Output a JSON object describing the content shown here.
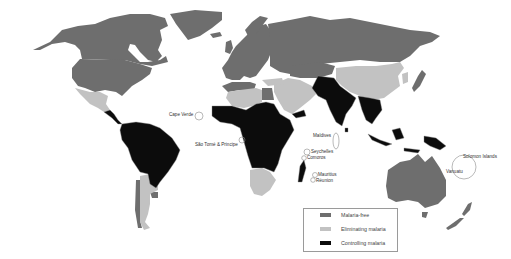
{
  "map": {
    "title": "",
    "colors": {
      "malaria_free": "#6e6e6e",
      "eliminating": "#c2c2c2",
      "controlling": "#0c0c0c",
      "ocean": "#ffffff",
      "border": "#8c8c8c"
    },
    "callouts": [
      {
        "id": "cape-verde",
        "label": "Cape Verde"
      },
      {
        "id": "sao-tome",
        "label": "São Tomé & Principe"
      },
      {
        "id": "maldives",
        "label": "Maldives"
      },
      {
        "id": "seychelles",
        "label": "Seychelles"
      },
      {
        "id": "comoros",
        "label": "Comoros"
      },
      {
        "id": "mauritius",
        "label": "Mauritius"
      },
      {
        "id": "reunion",
        "label": "Réunion"
      },
      {
        "id": "solomon-islands",
        "label": "Solomon Islands"
      },
      {
        "id": "vanuatu",
        "label": "Vanuatu"
      }
    ],
    "regions": {
      "malaria_free": [
        "North America (USA, Canada)",
        "Greenland",
        "Europe",
        "Russia",
        "Japan",
        "Australia",
        "New Zealand",
        "Chile (partial)",
        "Uruguay"
      ],
      "eliminating": [
        "Mexico",
        "Argentina",
        "Paraguay",
        "Algeria",
        "Libya",
        "Middle East",
        "China",
        "South Africa",
        "Botswana",
        "Namibia",
        "Central Asia"
      ],
      "controlling": [
        "Central America",
        "Brazil",
        "Colombia",
        "Venezuela",
        "Peru",
        "Bolivia",
        "Sub-Saharan Africa",
        "Madagascar",
        "India",
        "Pakistan",
        "Afghanistan",
        "Southeast Asia",
        "Indonesia",
        "Papua New Guinea"
      ]
    }
  },
  "legend": {
    "items": [
      {
        "label": "Malaria-free",
        "color": "#6e6e6e"
      },
      {
        "label": "Eliminating malaria",
        "color": "#c2c2c2"
      },
      {
        "label": "Controlling malaria",
        "color": "#0c0c0c"
      }
    ]
  }
}
